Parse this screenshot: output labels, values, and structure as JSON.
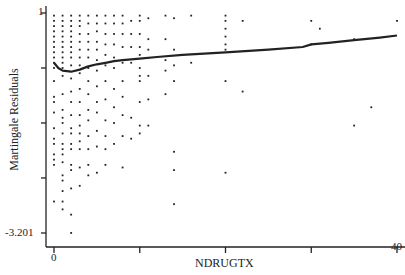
{
  "chart_data": {
    "type": "scatter",
    "title": "",
    "xlabel": "NDRUGTX",
    "ylabel": "Martingale Residuals",
    "xlim": [
      -1,
      41
    ],
    "ylim": [
      -3.35,
      1.15
    ],
    "x_ticks": [
      0,
      10,
      20,
      30,
      40
    ],
    "x_tick_labels": [
      "0",
      "",
      "",
      "",
      "40"
    ],
    "y_ticks": [
      1,
      -0.05,
      -1.1,
      -2.15,
      -3.201
    ],
    "y_tick_labels": [
      "1",
      "",
      "",
      "",
      "-3.201"
    ],
    "grid": false,
    "legend": null,
    "series": [
      {
        "name": "residuals",
        "kind": "points",
        "points": [
          [
            0,
            0.95
          ],
          [
            0,
            0.85
          ],
          [
            0,
            0.75
          ],
          [
            0,
            0.65
          ],
          [
            0,
            0.55
          ],
          [
            0,
            0.45
          ],
          [
            0,
            0.35
          ],
          [
            0,
            0.25
          ],
          [
            0,
            0.15
          ],
          [
            0,
            0.05
          ],
          [
            0,
            -0.05
          ],
          [
            0,
            -0.3
          ],
          [
            0,
            -0.6
          ],
          [
            0,
            -0.7
          ],
          [
            0,
            -0.9
          ],
          [
            0,
            -1.2
          ],
          [
            0,
            -1.4
          ],
          [
            0,
            -1.5
          ],
          [
            0,
            -1.7
          ],
          [
            0,
            -1.8
          ],
          [
            0,
            -1.9
          ],
          [
            0,
            -2.6
          ],
          [
            1,
            0.95
          ],
          [
            1,
            0.85
          ],
          [
            1,
            0.75
          ],
          [
            1,
            0.65
          ],
          [
            1,
            0.55
          ],
          [
            1,
            0.45
          ],
          [
            1,
            0.35
          ],
          [
            1,
            0.25
          ],
          [
            1,
            0.15
          ],
          [
            1,
            0.05
          ],
          [
            1,
            -0.05
          ],
          [
            1,
            -0.2
          ],
          [
            1,
            -0.55
          ],
          [
            1,
            -0.85
          ],
          [
            1,
            -1.0
          ],
          [
            1,
            -1.1
          ],
          [
            1,
            -1.3
          ],
          [
            1,
            -1.5
          ],
          [
            1,
            -1.6
          ],
          [
            1,
            -1.7
          ],
          [
            1,
            -1.85
          ],
          [
            1,
            -2.1
          ],
          [
            1,
            -2.2
          ],
          [
            1,
            -2.4
          ],
          [
            1,
            -2.6
          ],
          [
            1,
            -2.75
          ],
          [
            2,
            0.95
          ],
          [
            2,
            0.85
          ],
          [
            2,
            0.75
          ],
          [
            2,
            0.65
          ],
          [
            2,
            0.55
          ],
          [
            2,
            0.45
          ],
          [
            2,
            0.35
          ],
          [
            2,
            0.25
          ],
          [
            2,
            0.15
          ],
          [
            2,
            0.0
          ],
          [
            2,
            -0.25
          ],
          [
            2,
            -0.5
          ],
          [
            2,
            -0.7
          ],
          [
            2,
            -0.95
          ],
          [
            2,
            -1.2
          ],
          [
            2,
            -1.3
          ],
          [
            2,
            -1.5
          ],
          [
            2,
            -1.6
          ],
          [
            2,
            -1.9
          ],
          [
            2,
            -2.0
          ],
          [
            2,
            -2.35
          ],
          [
            2,
            -2.85
          ],
          [
            2,
            -3.2
          ],
          [
            3,
            0.95
          ],
          [
            3,
            0.85
          ],
          [
            3,
            0.75
          ],
          [
            3,
            0.6
          ],
          [
            3,
            0.45
          ],
          [
            3,
            0.3
          ],
          [
            3,
            0.15
          ],
          [
            3,
            0.0
          ],
          [
            3,
            -0.15
          ],
          [
            3,
            -0.45
          ],
          [
            3,
            -0.7
          ],
          [
            3,
            -0.95
          ],
          [
            3,
            -1.15
          ],
          [
            3,
            -1.3
          ],
          [
            3,
            -1.45
          ],
          [
            3,
            -1.6
          ],
          [
            3,
            -1.95
          ],
          [
            3,
            -2.3
          ],
          [
            4,
            0.95
          ],
          [
            4,
            0.8
          ],
          [
            4,
            0.6
          ],
          [
            4,
            0.45
          ],
          [
            4,
            0.3
          ],
          [
            4,
            0.15
          ],
          [
            4,
            -0.05
          ],
          [
            4,
            -0.3
          ],
          [
            4,
            -0.55
          ],
          [
            4,
            -0.85
          ],
          [
            4,
            -1.05
          ],
          [
            4,
            -1.35
          ],
          [
            4,
            -1.6
          ],
          [
            4,
            -1.9
          ],
          [
            4,
            -2.1
          ],
          [
            5,
            0.95
          ],
          [
            5,
            0.8
          ],
          [
            5,
            0.65
          ],
          [
            5,
            0.45
          ],
          [
            5,
            0.3
          ],
          [
            5,
            0.1
          ],
          [
            5,
            -0.1
          ],
          [
            5,
            -0.4
          ],
          [
            5,
            -0.7
          ],
          [
            5,
            -0.9
          ],
          [
            5,
            -1.25
          ],
          [
            5,
            -1.55
          ],
          [
            5,
            -2.05
          ],
          [
            6,
            0.95
          ],
          [
            6,
            0.8
          ],
          [
            6,
            0.6
          ],
          [
            6,
            0.4
          ],
          [
            6,
            0.2
          ],
          [
            6,
            0.0
          ],
          [
            6,
            -0.3
          ],
          [
            6,
            -0.65
          ],
          [
            6,
            -1.05
          ],
          [
            6,
            -1.35
          ],
          [
            6,
            -1.6
          ],
          [
            6,
            -1.9
          ],
          [
            7,
            0.95
          ],
          [
            7,
            0.8
          ],
          [
            7,
            0.6
          ],
          [
            7,
            0.4
          ],
          [
            7,
            0.15
          ],
          [
            7,
            -0.05
          ],
          [
            7,
            -0.45
          ],
          [
            7,
            -0.8
          ],
          [
            7,
            -1.1
          ],
          [
            7,
            -1.5
          ],
          [
            8,
            0.95
          ],
          [
            8,
            0.8
          ],
          [
            8,
            0.6
          ],
          [
            8,
            0.35
          ],
          [
            8,
            0.05
          ],
          [
            8,
            -0.3
          ],
          [
            8,
            -0.6
          ],
          [
            8,
            -0.95
          ],
          [
            8,
            -1.35
          ],
          [
            8,
            -1.95
          ],
          [
            9,
            0.85
          ],
          [
            9,
            0.6
          ],
          [
            9,
            0.35
          ],
          [
            9,
            0.05
          ],
          [
            9,
            -1.0
          ],
          [
            9,
            -1.4
          ],
          [
            10,
            0.95
          ],
          [
            10,
            0.85
          ],
          [
            10,
            0.6
          ],
          [
            10,
            0.35
          ],
          [
            10,
            0.2
          ],
          [
            10,
            -0.05
          ],
          [
            10,
            -0.2
          ],
          [
            10,
            -0.3
          ],
          [
            10,
            -0.7
          ],
          [
            10,
            -1.15
          ],
          [
            10,
            -1.3
          ],
          [
            11,
            0.9
          ],
          [
            11,
            0.5
          ],
          [
            11,
            0.3
          ],
          [
            11,
            -0.2
          ],
          [
            11,
            -0.65
          ],
          [
            11,
            -1.15
          ],
          [
            13,
            0.95
          ],
          [
            13,
            0.5
          ],
          [
            13,
            0.1
          ],
          [
            13,
            -0.1
          ],
          [
            13,
            -0.55
          ],
          [
            14,
            0.9
          ],
          [
            14,
            0.3
          ],
          [
            14,
            0.0
          ],
          [
            14,
            -0.3
          ],
          [
            14,
            -1.65
          ],
          [
            14,
            -2.0
          ],
          [
            14,
            -2.65
          ],
          [
            16,
            0.95
          ],
          [
            16,
            0.05
          ],
          [
            20,
            0.95
          ],
          [
            20,
            0.85
          ],
          [
            20,
            0.7
          ],
          [
            20,
            0.55
          ],
          [
            20,
            0.4
          ],
          [
            20,
            0.3
          ],
          [
            20,
            -0.3
          ],
          [
            20,
            -2.05
          ],
          [
            22,
            0.85
          ],
          [
            22,
            -0.5
          ],
          [
            30,
            0.85
          ],
          [
            30,
            0.4
          ],
          [
            31,
            0.7
          ],
          [
            35,
            0.5
          ],
          [
            35,
            -1.15
          ],
          [
            37,
            -0.8
          ],
          [
            40,
            0.85
          ]
        ]
      },
      {
        "name": "smooth",
        "kind": "line",
        "points": [
          [
            0,
            0.05
          ],
          [
            0.5,
            -0.05
          ],
          [
            1,
            -0.1
          ],
          [
            2,
            -0.12
          ],
          [
            3,
            -0.08
          ],
          [
            4,
            -0.02
          ],
          [
            5,
            0.02
          ],
          [
            6,
            0.05
          ],
          [
            7,
            0.08
          ],
          [
            8,
            0.1
          ],
          [
            10,
            0.13
          ],
          [
            12,
            0.16
          ],
          [
            15,
            0.2
          ],
          [
            20,
            0.25
          ],
          [
            25,
            0.3
          ],
          [
            29,
            0.35
          ],
          [
            30,
            0.4
          ],
          [
            32,
            0.43
          ],
          [
            35,
            0.48
          ],
          [
            38,
            0.53
          ],
          [
            40,
            0.57
          ]
        ]
      }
    ]
  },
  "axes": {
    "xlabel": "NDRUGTX",
    "ylabel": "Martingale Residuals",
    "y_top_label": "1",
    "y_bottom_label": "-3.201",
    "x_left_label": "0",
    "x_right_label": "40"
  },
  "colors": {
    "ink": "#222222",
    "background": "#ffffff"
  }
}
